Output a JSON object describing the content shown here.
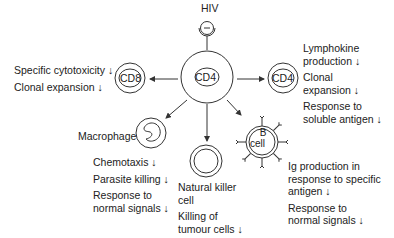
{
  "virus": {
    "label": "HIV"
  },
  "center_cell": {
    "label": "CD4"
  },
  "cells": {
    "cd8": {
      "label": "CD8",
      "effects": [
        "Specific cytotoxicity ↓",
        "Clonal expansion ↓"
      ]
    },
    "cd4_right": {
      "label": "CD4",
      "effects": [
        {
          "lines": [
            "Lymphokine",
            "production  ↓"
          ]
        },
        {
          "lines": [
            "Clonal",
            "expansion ↓"
          ]
        },
        {
          "lines": [
            "Response to",
            "soluble antigen ↓"
          ]
        }
      ]
    },
    "macrophage": {
      "label": "Macrophage",
      "effects": [
        {
          "lines": [
            "Chemotaxis ↓"
          ]
        },
        {
          "lines": [
            "Parasite killing ↓"
          ]
        },
        {
          "lines": [
            "Response to",
            "normal signals ↓"
          ]
        }
      ]
    },
    "nk": {
      "label_lines": [
        "Natural killer",
        "cell"
      ],
      "effects": [
        {
          "lines": [
            "Killing of",
            "tumour cells ↓"
          ]
        }
      ]
    },
    "bcell": {
      "label_lines": [
        "B",
        "cell"
      ],
      "effects": [
        {
          "lines": [
            "Ig production in",
            "response to specific",
            "antigen ↓"
          ]
        },
        {
          "lines": [
            "Response to",
            "normal signals ↓"
          ]
        }
      ]
    }
  },
  "colors": {
    "stroke": "#333333",
    "text": "#222222",
    "background": "#ffffff"
  }
}
